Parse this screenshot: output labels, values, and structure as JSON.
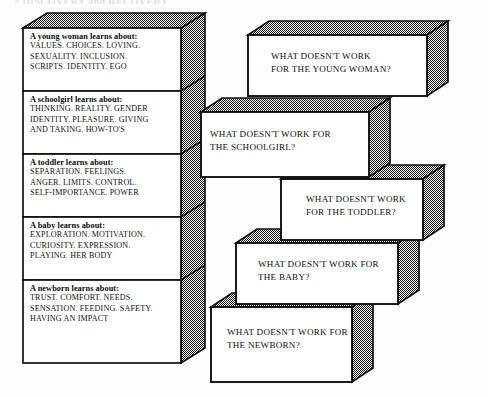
{
  "page": {
    "running_header": "2   DISCOVERY and RECOVERY",
    "background_color": "#fdfdfd",
    "ink_color": "#111111",
    "shade_color": "#8d8d8d"
  },
  "left_stack": {
    "name": "developmental-learning-stack",
    "blocks": [
      {
        "id": "young-woman",
        "lead": "A young woman learns about:",
        "lines": [
          "VALUES. CHOICES. LOVING.",
          "SEXUALITY. INCLUSION.",
          "SCRIPTS. IDENTITY. EGO"
        ]
      },
      {
        "id": "schoolgirl",
        "lead": "A schoolgirl learns about:",
        "lines": [
          "THINKING. REALITY. GENDER",
          "IDENTITY. PLEASURE. GIVING",
          "AND TAKING. HOW-TO'S"
        ]
      },
      {
        "id": "toddler",
        "lead": "A toddler learns about:",
        "lines": [
          "SEPARATION. FEELINGS.",
          "ANGER. LIMITS. CONTROL.",
          "SELF-IMPORTANCE. POWER"
        ]
      },
      {
        "id": "baby",
        "lead": "A baby learns about:",
        "lines": [
          "EXPLORATION. MOTIVATION.",
          "CURIOSITY. EXPRESSION.",
          "PLAYING. HER BODY"
        ]
      },
      {
        "id": "newborn",
        "lead": "A newborn learns about:",
        "lines": [
          "TRUST. COMFORT. NEEDS.",
          "SENSATION. FEEDING. SAFETY.",
          "HAVING AN IMPACT"
        ]
      }
    ]
  },
  "right_stack": {
    "name": "what-doesnt-work-stack",
    "blocks": [
      {
        "id": "young-woman-question",
        "lines": [
          "WHAT DOESN'T WORK",
          "FOR THE YOUNG WOMAN?"
        ]
      },
      {
        "id": "schoolgirl-question",
        "lines": [
          "WHAT DOESN'T WORK FOR",
          "THE SCHOOLGIRL?"
        ]
      },
      {
        "id": "toddler-question",
        "lines": [
          "WHAT DOESN'T WORK",
          "FOR THE TODDLER?"
        ]
      },
      {
        "id": "baby-question",
        "lines": [
          "WHAT DOESN'T WORK FOR",
          "THE BABY?"
        ]
      },
      {
        "id": "newborn-question",
        "lines": [
          "WHAT DOESN'T WORK FOR",
          "THE NEWBORN?"
        ]
      }
    ]
  }
}
